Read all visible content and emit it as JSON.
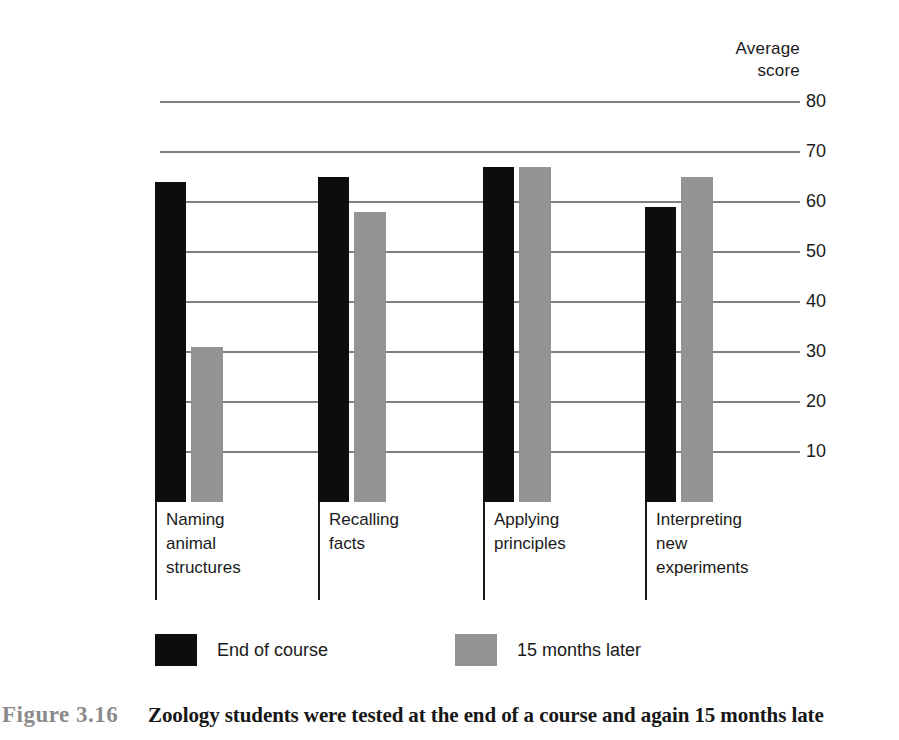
{
  "axis": {
    "title_line1": "Average",
    "title_line2": "score",
    "ticks": [
      {
        "label": "80",
        "value": 80
      },
      {
        "label": "70",
        "value": 70
      },
      {
        "label": "60",
        "value": 60
      },
      {
        "label": "50",
        "value": 50
      },
      {
        "label": "40",
        "value": 40
      },
      {
        "label": "30",
        "value": 30
      },
      {
        "label": "20",
        "value": 20
      },
      {
        "label": "10",
        "value": 10
      }
    ]
  },
  "groups": [
    {
      "label_lines": [
        "Naming",
        "animal",
        "structures"
      ],
      "end_of_course": 64,
      "months_later": 31
    },
    {
      "label_lines": [
        "Recalling",
        "facts"
      ],
      "end_of_course": 65,
      "months_later": 58
    },
    {
      "label_lines": [
        "Applying",
        "principles"
      ],
      "end_of_course": 67,
      "months_later": 67
    },
    {
      "label_lines": [
        "Interpreting",
        "new",
        "experiments"
      ],
      "end_of_course": 59,
      "months_later": 65
    }
  ],
  "legend": {
    "series1_label": "End of course",
    "series2_label": "15 months later",
    "series1_color": "#0d0d0d",
    "series2_color": "#949494"
  },
  "caption": {
    "number": "Figure 3.16",
    "text": "Zoology students were tested at the end of a course and again 15 months late"
  },
  "chart_data": {
    "type": "bar",
    "title": "",
    "subtitle": "",
    "xlabel": "",
    "ylabel": "Average score",
    "ylim": [
      0,
      80
    ],
    "yticks": [
      10,
      20,
      30,
      40,
      50,
      60,
      70,
      80
    ],
    "grid": true,
    "legend_position": "bottom",
    "categories": [
      "Naming animal structures",
      "Recalling facts",
      "Applying principles",
      "Interpreting new experiments"
    ],
    "series": [
      {
        "name": "End of course",
        "color": "#0d0d0d",
        "values": [
          64,
          65,
          67,
          59
        ]
      },
      {
        "name": "15 months later",
        "color": "#949494",
        "values": [
          31,
          58,
          67,
          65
        ]
      }
    ]
  }
}
